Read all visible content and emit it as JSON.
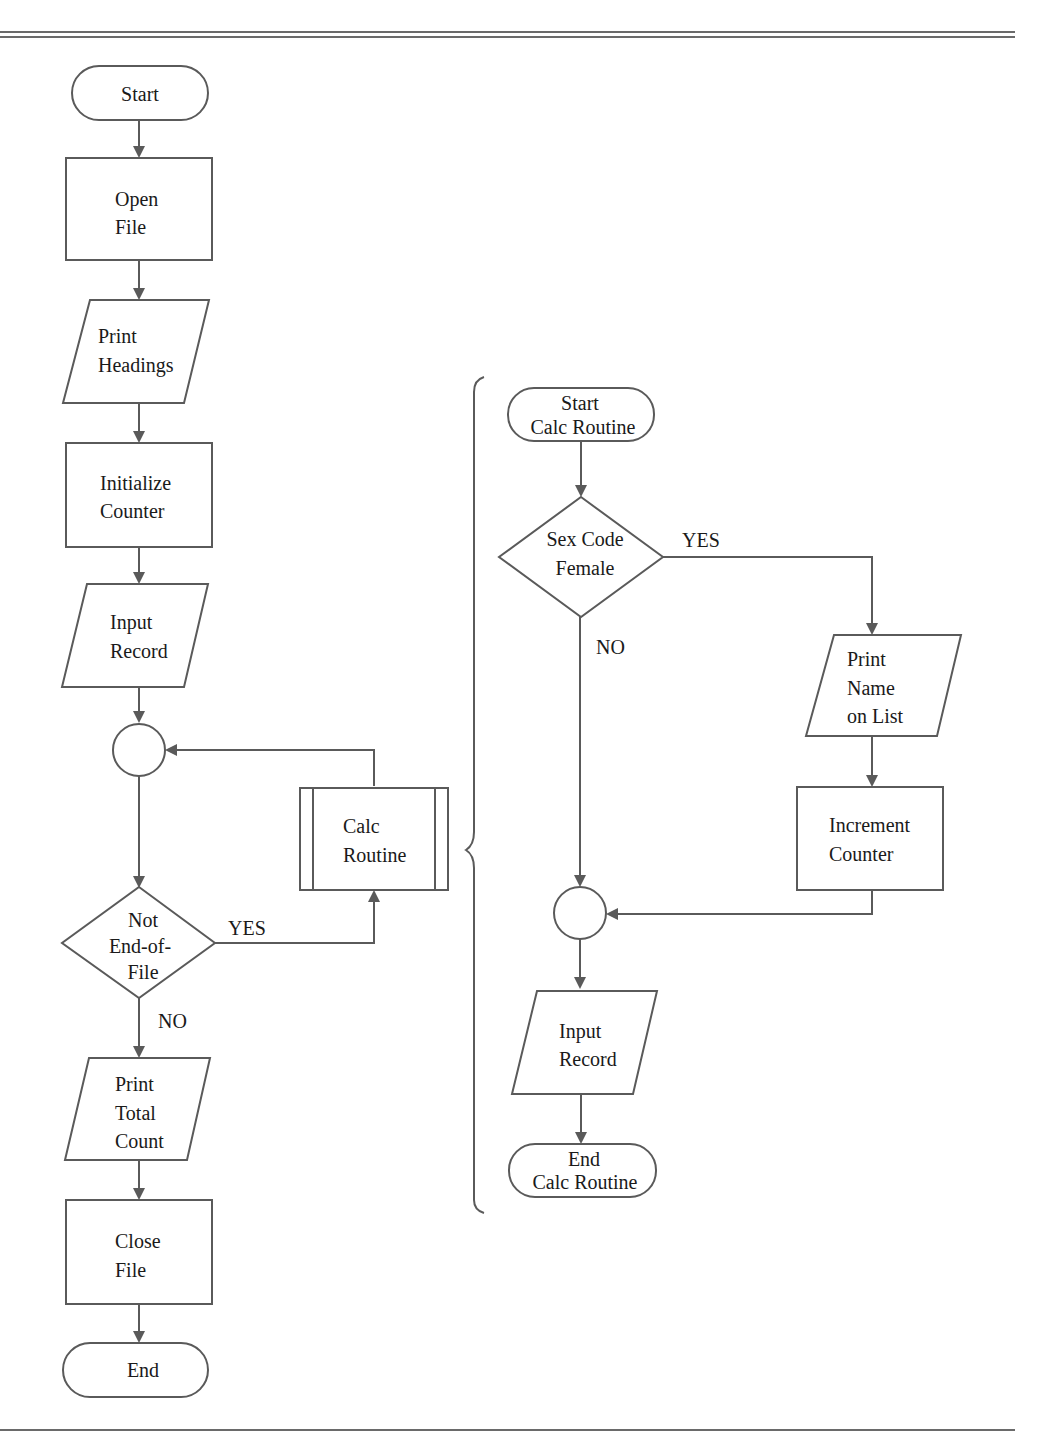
{
  "main_flow": {
    "start": "Start",
    "open_file": [
      "Open",
      "File"
    ],
    "print_headings": [
      "Print",
      "Headings"
    ],
    "init_counter": [
      "Initialize",
      "Counter"
    ],
    "input_record": [
      "Input",
      "Record"
    ],
    "decision": [
      "Not",
      "End-of-",
      "File"
    ],
    "calc_routine": [
      "Calc",
      "Routine"
    ],
    "yes_label": "YES",
    "no_label": "NO",
    "print_total": [
      "Print",
      "Total",
      "Count"
    ],
    "close_file": [
      "Close",
      "File"
    ],
    "end": "End"
  },
  "calc_flow": {
    "start": [
      "Start",
      "Calc Routine"
    ],
    "decision": [
      "Sex Code",
      "Female"
    ],
    "yes_label": "YES",
    "no_label": "NO",
    "print_name": [
      "Print",
      "Name",
      "on List"
    ],
    "increment": [
      "Increment",
      "Counter"
    ],
    "input_record": [
      "Input",
      "Record"
    ],
    "end": [
      "End",
      "Calc Routine"
    ]
  }
}
